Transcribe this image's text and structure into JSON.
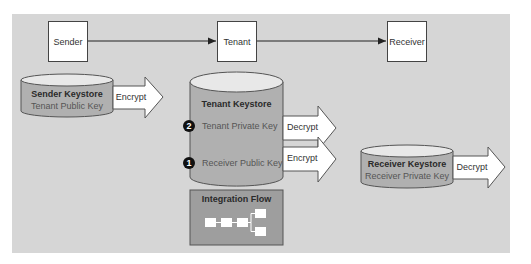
{
  "nodes": {
    "sender": "Sender",
    "tenant": "Tenant",
    "receiver": "Receiver"
  },
  "sender_keystore": {
    "title": "Sender Keystore",
    "key": "Tenant Public Key",
    "action": "Encrypt"
  },
  "tenant_keystore": {
    "title": "Tenant Keystore",
    "keys": [
      {
        "badge": "2",
        "label": "Tenant Private Key",
        "action": "Decrypt"
      },
      {
        "badge": "1",
        "label": "Receiver Public Key",
        "action": "Encrypt"
      }
    ]
  },
  "receiver_keystore": {
    "title": "Receiver Keystore",
    "key": "Receiver Private Key",
    "action": "Decrypt"
  },
  "integration_flow": {
    "title": "Integration Flow"
  },
  "colors": {
    "background": "#d6d6d6",
    "cylinder_body": "#b0b0b0",
    "cylinder_top": "#e8e8e8",
    "iflow_box": "#9e9e9e"
  }
}
